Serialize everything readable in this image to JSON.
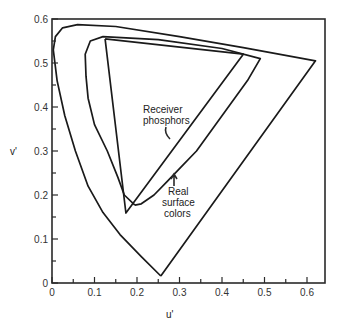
{
  "chart_data": {
    "type": "line",
    "title": "",
    "xlabel": "u'",
    "ylabel": "v'",
    "xlim": [
      0,
      0.64
    ],
    "ylim": [
      0,
      0.6
    ],
    "grid": false,
    "x_ticks": [
      "0",
      "0.1",
      "0.2",
      "0.3",
      "0.4",
      "0.5",
      "0.6"
    ],
    "y_ticks": [
      "0",
      "0.1",
      "0.2",
      "0.3",
      "0.4",
      "0.5",
      "0.6"
    ],
    "series": [
      {
        "name": "Spectrum locus",
        "points": [
          [
            0.256,
            0.016
          ],
          [
            0.21,
            0.06
          ],
          [
            0.16,
            0.11
          ],
          [
            0.12,
            0.16
          ],
          [
            0.085,
            0.22
          ],
          [
            0.055,
            0.3
          ],
          [
            0.03,
            0.38
          ],
          [
            0.012,
            0.46
          ],
          [
            0.003,
            0.53
          ],
          [
            0.008,
            0.56
          ],
          [
            0.025,
            0.58
          ],
          [
            0.06,
            0.587
          ],
          [
            0.15,
            0.583
          ],
          [
            0.3,
            0.56
          ],
          [
            0.45,
            0.535
          ],
          [
            0.62,
            0.505
          ],
          [
            0.256,
            0.016
          ]
        ]
      },
      {
        "name": "Real surface colors",
        "points": [
          [
            0.195,
            0.177
          ],
          [
            0.17,
            0.2
          ],
          [
            0.155,
            0.24
          ],
          [
            0.13,
            0.3
          ],
          [
            0.1,
            0.36
          ],
          [
            0.085,
            0.42
          ],
          [
            0.08,
            0.47
          ],
          [
            0.078,
            0.52
          ],
          [
            0.09,
            0.55
          ],
          [
            0.12,
            0.56
          ],
          [
            0.25,
            0.553
          ],
          [
            0.4,
            0.533
          ],
          [
            0.49,
            0.51
          ],
          [
            0.46,
            0.46
          ],
          [
            0.4,
            0.38
          ],
          [
            0.34,
            0.3
          ],
          [
            0.3,
            0.26
          ],
          [
            0.27,
            0.23
          ],
          [
            0.24,
            0.2
          ],
          [
            0.21,
            0.18
          ],
          [
            0.195,
            0.177
          ]
        ]
      },
      {
        "name": "Receiver phosphors",
        "points": [
          [
            0.125,
            0.555
          ],
          [
            0.45,
            0.52
          ],
          [
            0.174,
            0.159
          ],
          [
            0.125,
            0.555
          ]
        ]
      }
    ],
    "annotations": [
      {
        "text": "Receiver\nphosphors",
        "x": 0.3,
        "y": 0.37
      },
      {
        "text": "Real\nsurface\ncolors",
        "x": 0.33,
        "y": 0.22
      }
    ]
  },
  "labels": {
    "xlabel": "u'",
    "ylabel": "v'",
    "receiver_line1": "Receiver",
    "receiver_line2": "phosphors",
    "real_line1": "Real",
    "real_line2": "surface",
    "real_line3": "colors"
  }
}
